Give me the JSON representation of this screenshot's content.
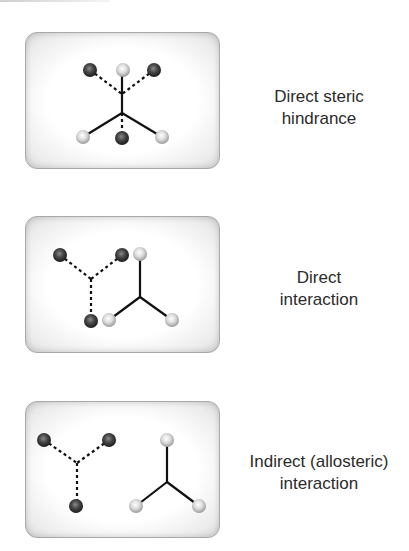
{
  "figure": {
    "panels": [
      {
        "id": "direct-steric-hindrance",
        "caption_lines": [
          "Direct steric",
          "hindrance"
        ],
        "description": "Dashed (dark) ligand and solid (light) ligand share the same binding site"
      },
      {
        "id": "direct-interaction",
        "caption_lines": [
          "Direct",
          "interaction"
        ],
        "description": "Dashed (dark) ligand and solid (light) ligand touch at adjacent atoms"
      },
      {
        "id": "indirect-allosteric-interaction",
        "caption_lines": [
          "Indirect (allosteric)",
          "interaction"
        ],
        "description": "Dashed (dark) ligand and solid (light) ligand are spatially separated"
      }
    ],
    "colors": {
      "dark_sphere": "#3a3a3a",
      "light_sphere": "#c8c8c8",
      "bond": "#111111",
      "panel_border": "#a9a9a9",
      "text": "#2b2b2b"
    }
  }
}
